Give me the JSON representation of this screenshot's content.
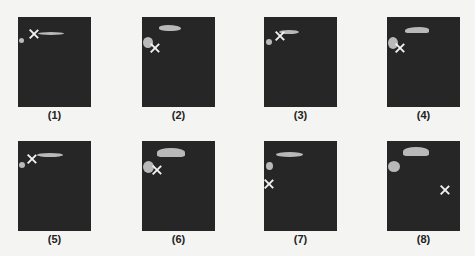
{
  "figure": {
    "panels": [
      {
        "label": "(1)",
        "x": 18,
        "y": 17,
        "blobs": [
          {
            "x": 20,
            "y": 15,
            "w": 26,
            "h": 3,
            "r": "50%/50%"
          },
          {
            "x": 1,
            "y": 21,
            "w": 5,
            "h": 5,
            "r": "50%"
          }
        ],
        "marker": {
          "x": 11,
          "y": 12
        }
      },
      {
        "label": "(2)",
        "x": 142,
        "y": 17,
        "blobs": [
          {
            "x": 17,
            "y": 8,
            "w": 22,
            "h": 6,
            "r": "40% 60% 40% 40%"
          },
          {
            "x": 1,
            "y": 20,
            "w": 10,
            "h": 11,
            "r": "50%"
          }
        ],
        "marker": {
          "x": 8,
          "y": 26
        }
      },
      {
        "label": "(3)",
        "x": 264,
        "y": 17,
        "blobs": [
          {
            "x": 15,
            "y": 13,
            "w": 20,
            "h": 4,
            "r": "50%"
          },
          {
            "x": 2,
            "y": 22,
            "w": 6,
            "h": 6,
            "r": "50%"
          }
        ],
        "marker": {
          "x": 11,
          "y": 14
        }
      },
      {
        "label": "(4)",
        "x": 387,
        "y": 17,
        "blobs": [
          {
            "x": 18,
            "y": 10,
            "w": 24,
            "h": 6,
            "r": "60% 40% 20% 20%"
          },
          {
            "x": 1,
            "y": 20,
            "w": 10,
            "h": 12,
            "r": "50%"
          }
        ],
        "marker": {
          "x": 8,
          "y": 26
        }
      },
      {
        "label": "(5)",
        "x": 18,
        "y": 141,
        "blobs": [
          {
            "x": 19,
            "y": 12,
            "w": 26,
            "h": 4,
            "r": "50%"
          },
          {
            "x": 1,
            "y": 21,
            "w": 6,
            "h": 6,
            "r": "50%"
          }
        ],
        "marker": {
          "x": 9,
          "y": 13
        }
      },
      {
        "label": "(6)",
        "x": 142,
        "y": 141,
        "blobs": [
          {
            "x": 15,
            "y": 7,
            "w": 28,
            "h": 9,
            "r": "50% 50% 20% 20%"
          },
          {
            "x": 1,
            "y": 20,
            "w": 11,
            "h": 12,
            "r": "50%"
          }
        ],
        "marker": {
          "x": 10,
          "y": 24
        }
      },
      {
        "label": "(7)",
        "x": 264,
        "y": 141,
        "blobs": [
          {
            "x": 12,
            "y": 11,
            "w": 27,
            "h": 5,
            "r": "50%"
          },
          {
            "x": 2,
            "y": 21,
            "w": 7,
            "h": 8,
            "r": "50%"
          }
        ],
        "marker": {
          "x": 0,
          "y": 38
        }
      },
      {
        "label": "(8)",
        "x": 387,
        "y": 141,
        "blobs": [
          {
            "x": 16,
            "y": 6,
            "w": 26,
            "h": 9,
            "r": "50% 50% 20% 20%"
          },
          {
            "x": 1,
            "y": 20,
            "w": 12,
            "h": 11,
            "r": "50%"
          }
        ],
        "marker": {
          "x": 53,
          "y": 44
        }
      }
    ]
  }
}
